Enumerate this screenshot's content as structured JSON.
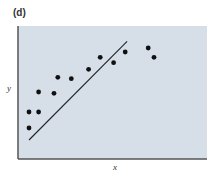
{
  "panel": {
    "label": "(d)"
  },
  "axes": {
    "xlabel": "x",
    "ylabel": "y"
  },
  "colors": {
    "plot_background": "#d6dfe8",
    "axis": "#555555",
    "points": "#111111",
    "line": "#222222"
  },
  "chart_data": {
    "type": "scatter",
    "title": "(d)",
    "xlabel": "x",
    "ylabel": "y",
    "grid": false,
    "legend": null,
    "xlim": [
      0,
      100
    ],
    "ylim": [
      0,
      100
    ],
    "series": [
      {
        "name": "observations",
        "type": "scatter",
        "points": [
          {
            "x": 6,
            "y": 35
          },
          {
            "x": 6,
            "y": 23
          },
          {
            "x": 11,
            "y": 35
          },
          {
            "x": 11,
            "y": 50
          },
          {
            "x": 19,
            "y": 49
          },
          {
            "x": 21,
            "y": 61
          },
          {
            "x": 28,
            "y": 60
          },
          {
            "x": 37,
            "y": 67
          },
          {
            "x": 43,
            "y": 76
          },
          {
            "x": 50,
            "y": 72
          },
          {
            "x": 56,
            "y": 80
          },
          {
            "x": 68,
            "y": 83
          },
          {
            "x": 71,
            "y": 76
          }
        ]
      },
      {
        "name": "linear fit",
        "type": "line",
        "points": [
          {
            "x": 6,
            "y": 14
          },
          {
            "x": 57,
            "y": 88
          }
        ]
      }
    ]
  }
}
